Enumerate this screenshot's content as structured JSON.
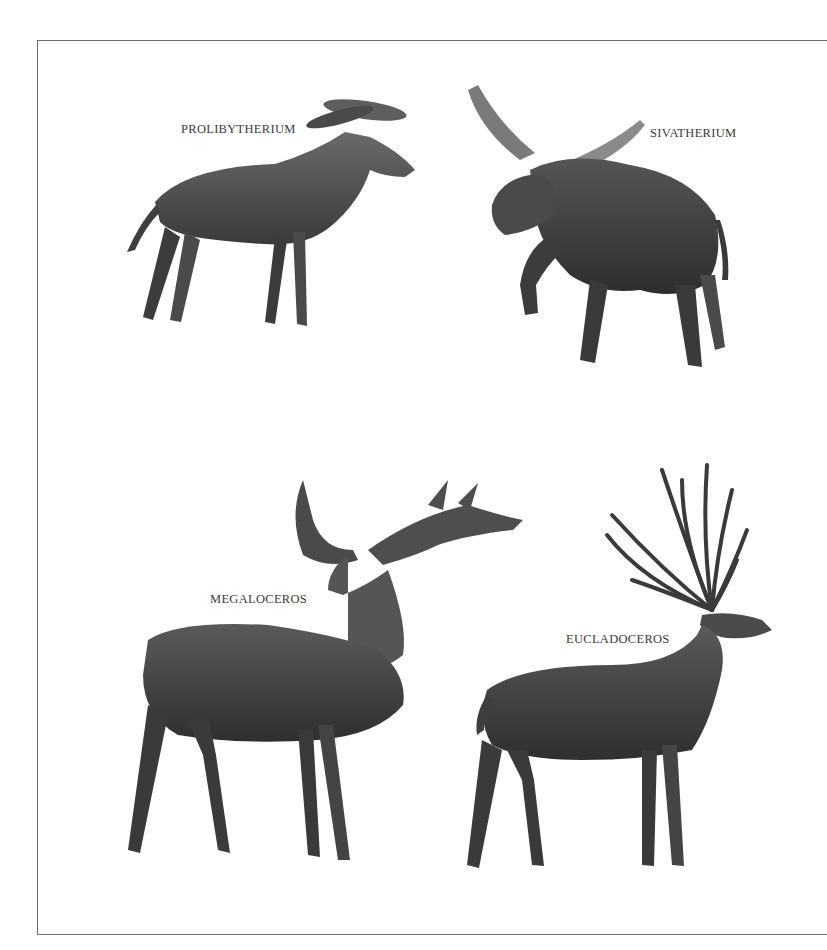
{
  "plate": {
    "colors": {
      "background": "#ffffff",
      "frame": "#6f6f6f",
      "label": "#3a3a3a",
      "ink_dark": "#2b2b2b",
      "ink_mid": "#5a5a5a",
      "ink_light": "#9a9a9a"
    }
  },
  "animals": [
    {
      "name": "PROLIBYTHERIUM",
      "position": "top-left"
    },
    {
      "name": "SIVATHERIUM",
      "position": "top-right"
    },
    {
      "name": "MEGALOCEROS",
      "position": "bottom-left"
    },
    {
      "name": "EUCLADOCEROS",
      "position": "bottom-right"
    }
  ]
}
